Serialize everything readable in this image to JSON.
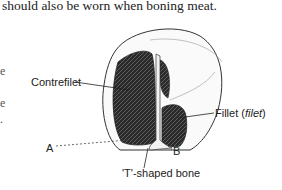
{
  "text": {
    "line1": "should also be worn when boning meat."
  },
  "figure": {
    "labels": {
      "contrefilet": "Contrefilet",
      "fillet": "Fillet (",
      "fillet_italic": "filet",
      "fillet_close": ")",
      "point_a": "A",
      "point_b": "B",
      "bone": "'T'-shaped bone"
    }
  },
  "edge_fragments": [
    "e",
    "e",
    "."
  ]
}
